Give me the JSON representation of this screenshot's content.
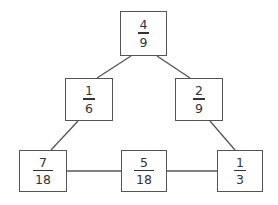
{
  "diagram": {
    "type": "fraction-triangle",
    "line_color": "#555555",
    "text_color": "#333333",
    "nodes": [
      {
        "id": "top",
        "numerator": "4",
        "denominator": "9",
        "x": 120,
        "y": 11,
        "w": 47,
        "h": 45
      },
      {
        "id": "mid-left",
        "numerator": "1",
        "denominator": "6",
        "x": 65,
        "y": 78,
        "w": 48,
        "h": 43
      },
      {
        "id": "mid-right",
        "numerator": "2",
        "denominator": "9",
        "x": 175,
        "y": 78,
        "w": 48,
        "h": 43
      },
      {
        "id": "bottom-left",
        "numerator": "7",
        "denominator": "18",
        "x": 19,
        "y": 150,
        "w": 48,
        "h": 42
      },
      {
        "id": "bottom-middle",
        "numerator": "5",
        "denominator": "18",
        "x": 121,
        "y": 150,
        "w": 46,
        "h": 42
      },
      {
        "id": "bottom-right",
        "numerator": "1",
        "denominator": "3",
        "x": 217,
        "y": 150,
        "w": 46,
        "h": 42
      }
    ],
    "edges": [
      {
        "from": "top",
        "to": "mid-left"
      },
      {
        "from": "top",
        "to": "mid-right"
      },
      {
        "from": "mid-left",
        "to": "bottom-left"
      },
      {
        "from": "mid-right",
        "to": "bottom-right"
      },
      {
        "from": "bottom-left",
        "to": "bottom-middle"
      },
      {
        "from": "bottom-middle",
        "to": "bottom-right"
      }
    ]
  }
}
